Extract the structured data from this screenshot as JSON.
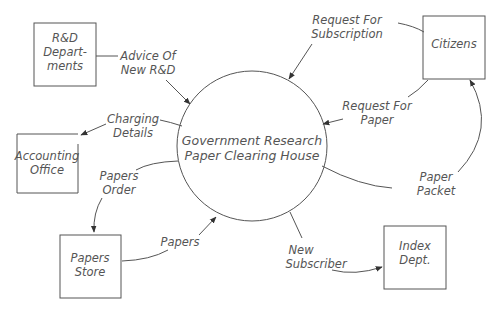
{
  "diagram": {
    "type": "data-flow-diagram",
    "process": {
      "line1": "Government Research",
      "line2": "Paper Clearing House"
    },
    "entities": [
      {
        "id": "rnd",
        "line1": "R&D",
        "line2": "Depart-",
        "line3": "ments"
      },
      {
        "id": "citizens",
        "line1": "Citizens"
      },
      {
        "id": "accounting",
        "line1": "Accounting",
        "line2": "Office"
      },
      {
        "id": "store",
        "line1": "Papers",
        "line2": "Store"
      },
      {
        "id": "index",
        "line1": "Index",
        "line2": "Dept."
      }
    ],
    "flows": [
      {
        "id": "advice",
        "line1": "Advice Of",
        "line2": "New R&D",
        "from": "R&D Departments",
        "to": "Government Research Paper Clearing House"
      },
      {
        "id": "req-sub",
        "line1": "Request For",
        "line2": "Subscription",
        "from": "Citizens",
        "to": "Government Research Paper Clearing House"
      },
      {
        "id": "req-paper",
        "line1": "Request For",
        "line2": "Paper",
        "from": "Citizens",
        "to": "Government Research Paper Clearing House"
      },
      {
        "id": "charging",
        "line1": "Charging",
        "line2": "Details",
        "from": "Government Research Paper Clearing House",
        "to": "Accounting Office"
      },
      {
        "id": "order",
        "line1": "Papers",
        "line2": "Order",
        "from": "Government Research Paper Clearing House",
        "to": "Papers Store"
      },
      {
        "id": "papers",
        "line1": "Papers",
        "from": "Papers Store",
        "to": "Government Research Paper Clearing House"
      },
      {
        "id": "packet",
        "line1": "Paper",
        "line2": "Packet",
        "from": "Government Research Paper Clearing House",
        "to": "Citizens"
      },
      {
        "id": "subscriber",
        "line1": "New",
        "line2": "Subscriber",
        "from": "Government Research Paper Clearing House",
        "to": "Index Dept."
      }
    ],
    "colors": {
      "stroke": "#555555",
      "text": "#555555",
      "background": "#ffffff"
    }
  }
}
